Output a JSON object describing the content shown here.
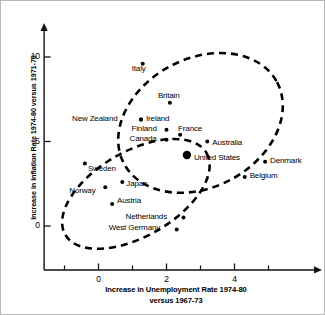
{
  "chart_data": {
    "type": "scatter",
    "title": "",
    "xlabel": "Increase in Unemployment Rate 1974-80 versus 1967-73",
    "xlabel_line1": "Increase in Unemployment Rate 1974-80",
    "xlabel_line2": "versus 1967-73",
    "ylabel": "Increase in Inflation Rate 1974-80 versus 1971-73",
    "xlim": [
      -1.6,
      5.9
    ],
    "ylim": [
      -2.6,
      11.2
    ],
    "xticks": [
      0,
      2,
      4
    ],
    "xtick_labels": [
      "0",
      "2",
      "4"
    ],
    "xminor_ticks": [
      -1,
      1,
      3,
      5
    ],
    "yticks": [
      0,
      5,
      10
    ],
    "ytick_labels": [
      "0",
      "5",
      "10"
    ],
    "grid": false,
    "legend": "none",
    "points": [
      {
        "name": "Italy",
        "x": 1.3,
        "y": 9.6,
        "label_dx": -11,
        "label_dy": 9,
        "big": false
      },
      {
        "name": "Britain",
        "x": 2.1,
        "y": 7.3,
        "label_dx": -12,
        "label_dy": -3,
        "big": false
      },
      {
        "name": "New Zealand",
        "x": 1.25,
        "y": 6.3,
        "label_dx": -69,
        "label_dy": 3,
        "big": false
      },
      {
        "name": "Ireland",
        "x": 1.25,
        "y": 6.3,
        "label_dx": 5,
        "label_dy": 3,
        "big": false
      },
      {
        "name": "Finland",
        "x": 2.0,
        "y": 5.7,
        "label_dx": -35,
        "label_dy": 3,
        "big": false
      },
      {
        "name": "France",
        "x": 2.4,
        "y": 5.4,
        "label_dx": -2,
        "label_dy": -2,
        "big": false
      },
      {
        "name": "Canada",
        "x": 2.0,
        "y": 5.1,
        "label_dx": -37,
        "label_dy": 3,
        "big": false
      },
      {
        "name": "Australia",
        "x": 3.2,
        "y": 5.0,
        "label_dx": 5,
        "label_dy": 5,
        "big": false
      },
      {
        "name": "United States",
        "x": 2.6,
        "y": 4.2,
        "label_dx": 7,
        "label_dy": 7,
        "big": true
      },
      {
        "name": "Denmark",
        "x": 4.9,
        "y": 3.8,
        "label_dx": 5,
        "label_dy": 3,
        "big": false
      },
      {
        "name": "Belgium",
        "x": 4.3,
        "y": 2.9,
        "label_dx": 5,
        "label_dy": 3,
        "big": false
      },
      {
        "name": "Sweden",
        "x": -0.4,
        "y": 3.7,
        "label_dx": 3,
        "label_dy": 10,
        "big": false
      },
      {
        "name": "Japan",
        "x": 0.7,
        "y": 2.6,
        "label_dx": 4,
        "label_dy": 6,
        "big": false
      },
      {
        "name": "Norway",
        "x": 0.2,
        "y": 2.3,
        "label_dx": -36,
        "label_dy": 8,
        "big": false
      },
      {
        "name": "Austria",
        "x": 0.4,
        "y": 1.3,
        "label_dx": 5,
        "label_dy": 1,
        "big": false
      },
      {
        "name": "Netherlands",
        "x": 2.5,
        "y": 0.5,
        "label_dx": -58,
        "label_dy": 3,
        "big": false
      },
      {
        "name": "West Germany",
        "x": 2.3,
        "y": -0.2,
        "label_dx": -68,
        "label_dy": 3,
        "big": false
      }
    ],
    "groupings": [
      {
        "name": "upper-cluster-ellipse",
        "cx": 3.0,
        "cy": 6.1,
        "rx": 2.55,
        "ry": 2.35,
        "rotation": -28
      },
      {
        "name": "lower-cluster-ellipse",
        "cx": 1.1,
        "cy": 1.9,
        "rx": 2.4,
        "ry": 1.55,
        "rotation": -30
      }
    ]
  },
  "axes": {
    "y_title": "Increase in Inflation Rate 1974-80 versus 1971-73",
    "x_title_line1": "Increase in Unemployment Rate 1974-80",
    "x_title_line2": "versus 1967-73"
  }
}
